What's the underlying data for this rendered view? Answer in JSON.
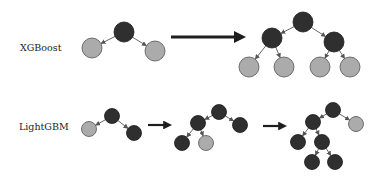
{
  "colors": {
    "dark_node": "#2f2f2f",
    "light_node": "#ababab",
    "node_stroke": "#555555",
    "edge": "#555555",
    "arrow": "#1e1e1e"
  },
  "rows": [
    {
      "label": "XGBoost",
      "label_pos": [
        20,
        42
      ],
      "node_r": 10,
      "trees": [
        {
          "nodes": [
            {
              "x": 124,
              "y": 32,
              "type": "dark"
            },
            {
              "x": 92,
              "y": 48,
              "type": "light"
            },
            {
              "x": 155,
              "y": 51,
              "type": "light"
            }
          ],
          "edges": [
            [
              0,
              1
            ],
            [
              0,
              2
            ]
          ]
        },
        {
          "nodes": [
            {
              "x": 303,
              "y": 22,
              "type": "dark"
            },
            {
              "x": 272,
              "y": 38,
              "type": "dark"
            },
            {
              "x": 334,
              "y": 42,
              "type": "dark"
            },
            {
              "x": 249,
              "y": 67,
              "type": "light"
            },
            {
              "x": 284,
              "y": 67,
              "type": "light"
            },
            {
              "x": 320,
              "y": 67,
              "type": "light"
            },
            {
              "x": 350,
              "y": 67,
              "type": "light"
            }
          ],
          "edges": [
            [
              0,
              1
            ],
            [
              0,
              2
            ],
            [
              1,
              3
            ],
            [
              1,
              4
            ],
            [
              2,
              5
            ],
            [
              2,
              6
            ]
          ]
        }
      ],
      "arrows": [
        {
          "x1": 171,
          "y1": 37,
          "x2": 246,
          "y2": 37,
          "width": 3
        }
      ]
    },
    {
      "label": "LightGBM",
      "label_pos": [
        19,
        121
      ],
      "node_r": 7.5,
      "trees": [
        {
          "nodes": [
            {
              "x": 112,
              "y": 116,
              "type": "dark"
            },
            {
              "x": 89,
              "y": 129,
              "type": "light"
            },
            {
              "x": 134,
              "y": 133,
              "type": "dark"
            }
          ],
          "edges": [
            [
              0,
              1
            ],
            [
              0,
              2
            ]
          ]
        },
        {
          "nodes": [
            {
              "x": 219,
              "y": 112,
              "type": "dark"
            },
            {
              "x": 198,
              "y": 123,
              "type": "dark"
            },
            {
              "x": 240,
              "y": 125,
              "type": "dark"
            },
            {
              "x": 182,
              "y": 143,
              "type": "dark"
            },
            {
              "x": 206,
              "y": 143,
              "type": "light"
            }
          ],
          "edges": [
            [
              0,
              1
            ],
            [
              0,
              2
            ],
            [
              1,
              3
            ],
            [
              1,
              4
            ]
          ]
        },
        {
          "nodes": [
            {
              "x": 333,
              "y": 110,
              "type": "dark"
            },
            {
              "x": 313,
              "y": 122,
              "type": "dark"
            },
            {
              "x": 356,
              "y": 124,
              "type": "light"
            },
            {
              "x": 298,
              "y": 142,
              "type": "dark"
            },
            {
              "x": 322,
              "y": 142,
              "type": "dark"
            },
            {
              "x": 312,
              "y": 162,
              "type": "dark"
            },
            {
              "x": 335,
              "y": 162,
              "type": "dark"
            }
          ],
          "edges": [
            [
              0,
              1
            ],
            [
              0,
              2
            ],
            [
              1,
              3
            ],
            [
              1,
              4
            ],
            [
              4,
              5
            ],
            [
              4,
              6
            ]
          ]
        }
      ],
      "arrows": [
        {
          "x1": 148,
          "y1": 125,
          "x2": 172,
          "y2": 125,
          "width": 2.2
        },
        {
          "x1": 263,
          "y1": 126,
          "x2": 287,
          "y2": 126,
          "width": 2.2
        }
      ]
    }
  ]
}
